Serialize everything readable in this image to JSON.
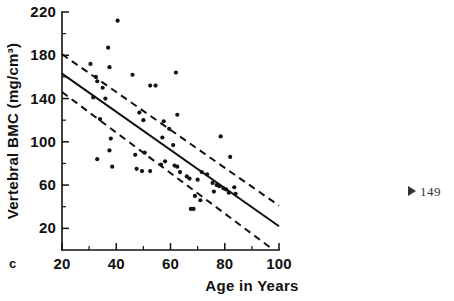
{
  "figure": {
    "panel_label": "c",
    "page_marker": {
      "icon": "triangle-right-icon",
      "text": "149"
    }
  },
  "chart_data": {
    "type": "scatter",
    "title": "",
    "xlabel": "Age in Years",
    "ylabel": "Vertebral BMC (mg/cm³)",
    "xlim": [
      20,
      100
    ],
    "ylim": [
      0,
      220
    ],
    "grid": false,
    "legend": "none",
    "xticks": [
      20,
      40,
      60,
      80,
      100
    ],
    "xtick_labels": [
      "20",
      "40",
      "60",
      "80",
      "100"
    ],
    "xminor_ticks": [
      30,
      50,
      70,
      90
    ],
    "yticks": [
      20,
      60,
      100,
      140,
      180,
      220
    ],
    "ytick_labels": [
      "20",
      "60",
      "100",
      "140",
      "180",
      "220"
    ],
    "yminor_ticks": [
      40,
      80,
      120,
      160,
      200
    ],
    "points": [
      [
        40.5,
        212
      ],
      [
        37.0,
        187
      ],
      [
        30.5,
        172
      ],
      [
        37.5,
        169
      ],
      [
        46.0,
        162
      ],
      [
        62.0,
        164
      ],
      [
        32.5,
        160
      ],
      [
        33.0,
        156
      ],
      [
        52.5,
        152
      ],
      [
        54.5,
        152
      ],
      [
        35.0,
        150
      ],
      [
        31.5,
        141
      ],
      [
        36.0,
        140
      ],
      [
        48.5,
        127
      ],
      [
        62.5,
        125
      ],
      [
        34.0,
        121
      ],
      [
        50.0,
        120
      ],
      [
        57.5,
        119
      ],
      [
        59.5,
        112
      ],
      [
        38.0,
        103
      ],
      [
        78.5,
        105
      ],
      [
        57.0,
        104
      ],
      [
        61.0,
        97
      ],
      [
        50.5,
        90
      ],
      [
        37.5,
        92
      ],
      [
        47.0,
        88
      ],
      [
        33.0,
        84
      ],
      [
        58.0,
        82
      ],
      [
        82.0,
        86
      ],
      [
        56.5,
        79
      ],
      [
        61.5,
        78
      ],
      [
        62.5,
        77
      ],
      [
        38.5,
        77
      ],
      [
        47.5,
        75
      ],
      [
        49.5,
        73
      ],
      [
        52.5,
        73
      ],
      [
        63.5,
        72
      ],
      [
        66.0,
        68
      ],
      [
        67.0,
        66
      ],
      [
        71.5,
        72
      ],
      [
        73.5,
        70
      ],
      [
        70.0,
        65
      ],
      [
        75.5,
        62
      ],
      [
        77.0,
        60
      ],
      [
        78.0,
        59
      ],
      [
        79.5,
        57
      ],
      [
        80.5,
        56
      ],
      [
        76.0,
        54
      ],
      [
        81.5,
        53
      ],
      [
        83.5,
        58
      ],
      [
        69.0,
        50
      ],
      [
        67.5,
        38
      ],
      [
        68.5,
        38
      ],
      [
        71.0,
        46
      ],
      [
        84.0,
        52
      ]
    ],
    "fit_line": {
      "name": "regression line",
      "style": "solid",
      "x": [
        20,
        100
      ],
      "y": [
        163,
        22
      ]
    },
    "bands": [
      {
        "name": "upper confidence band",
        "style": "dashed",
        "x": [
          20,
          100
        ],
        "y": [
          181,
          41
        ]
      },
      {
        "name": "lower confidence band",
        "style": "dashed",
        "x": [
          20,
          98
        ],
        "y": [
          146,
          0
        ]
      }
    ]
  }
}
